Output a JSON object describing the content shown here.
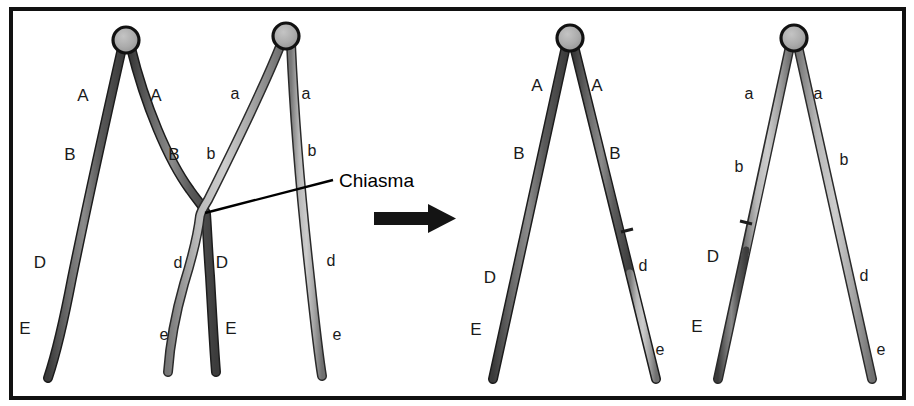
{
  "figure": {
    "frame": {
      "border_color": "#111111",
      "background": "#ffffff"
    },
    "colors": {
      "dark_chromatid": "#595959",
      "dark_chromatid_outline": "#1c1c1c",
      "light_chromatid": "#ababab",
      "light_chromatid_outline": "#2a2a2a",
      "centromere_fill": "#adadad",
      "centromere_outline": "#111111",
      "arrow": "#141414",
      "leader_line": "#000000",
      "text": "#1a1a1a"
    }
  },
  "annotations": {
    "chiasma_label": "Chiasma",
    "arrow_name": "transition-arrow"
  },
  "panels": [
    {
      "id": "panel-before-left",
      "name": "homolog-pair-dominant-before",
      "side": "before",
      "centromere": {
        "cx": 126,
        "cy": 40,
        "r": 13
      },
      "chromatids": [
        {
          "name": "chromatid-dominant-left",
          "shade": "dark",
          "labels": [
            {
              "text": "A",
              "x": 83,
              "y": 101
            },
            {
              "text": "B",
              "x": 70,
              "y": 160
            },
            {
              "text": "D",
              "x": 40,
              "y": 268
            },
            {
              "text": "E",
              "x": 25,
              "y": 334
            }
          ]
        },
        {
          "name": "chromatid-dominant-right-crossed",
          "shade": "dark",
          "labels": [
            {
              "text": "A",
              "x": 156,
              "y": 101
            },
            {
              "text": "B",
              "x": 174,
              "y": 160
            },
            {
              "text": "D",
              "x": 222,
              "y": 268
            },
            {
              "text": "E",
              "x": 231,
              "y": 334
            }
          ]
        }
      ]
    },
    {
      "id": "panel-before-right",
      "name": "homolog-pair-recessive-before",
      "side": "before",
      "centromere": {
        "cx": 286,
        "cy": 36,
        "r": 13
      },
      "chromatids": [
        {
          "name": "chromatid-recessive-left-crossed",
          "shade": "light",
          "labels": [
            {
              "text": "a",
              "x": 235,
              "y": 99
            },
            {
              "text": "b",
              "x": 211,
              "y": 159
            },
            {
              "text": "d",
              "x": 178,
              "y": 268
            },
            {
              "text": "e",
              "x": 164,
              "y": 340
            }
          ]
        },
        {
          "name": "chromatid-recessive-right",
          "shade": "light",
          "labels": [
            {
              "text": "a",
              "x": 306,
              "y": 99
            },
            {
              "text": "b",
              "x": 312,
              "y": 156
            },
            {
              "text": "d",
              "x": 331,
              "y": 266
            },
            {
              "text": "e",
              "x": 337,
              "y": 340
            }
          ]
        }
      ]
    },
    {
      "id": "panel-after-left",
      "name": "homolog-pair-dominant-after",
      "side": "after",
      "centromere": {
        "cx": 570,
        "cy": 38,
        "r": 13
      },
      "chromatids": [
        {
          "name": "chromatid-parental-ABDE",
          "shade": "dark",
          "labels": [
            {
              "text": "A",
              "x": 537,
              "y": 91
            },
            {
              "text": "B",
              "x": 519,
              "y": 159
            },
            {
              "text": "D",
              "x": 490,
              "y": 283
            },
            {
              "text": "E",
              "x": 476,
              "y": 335
            }
          ]
        },
        {
          "name": "chromatid-recombinant-ABde",
          "shade": "dark-top-light-bottom",
          "labels": [
            {
              "text": "A",
              "x": 597,
              "y": 91
            },
            {
              "text": "B",
              "x": 615,
              "y": 159
            },
            {
              "text": "d",
              "x": 643,
              "y": 271
            },
            {
              "text": "e",
              "x": 660,
              "y": 355
            }
          ]
        }
      ]
    },
    {
      "id": "panel-after-right",
      "name": "homolog-pair-recessive-after",
      "side": "after",
      "centromere": {
        "cx": 794,
        "cy": 38,
        "r": 13
      },
      "chromatids": [
        {
          "name": "chromatid-recombinant-abDE",
          "shade": "light-top-dark-bottom",
          "labels": [
            {
              "text": "a",
              "x": 749,
              "y": 99
            },
            {
              "text": "b",
              "x": 739,
              "y": 172
            },
            {
              "text": "D",
              "x": 713,
              "y": 262
            },
            {
              "text": "E",
              "x": 697,
              "y": 332
            }
          ]
        },
        {
          "name": "chromatid-parental-abde",
          "shade": "light",
          "labels": [
            {
              "text": "a",
              "x": 818,
              "y": 99
            },
            {
              "text": "b",
              "x": 844,
              "y": 165
            },
            {
              "text": "d",
              "x": 864,
              "y": 281
            },
            {
              "text": "e",
              "x": 881,
              "y": 355
            }
          ]
        }
      ]
    }
  ]
}
